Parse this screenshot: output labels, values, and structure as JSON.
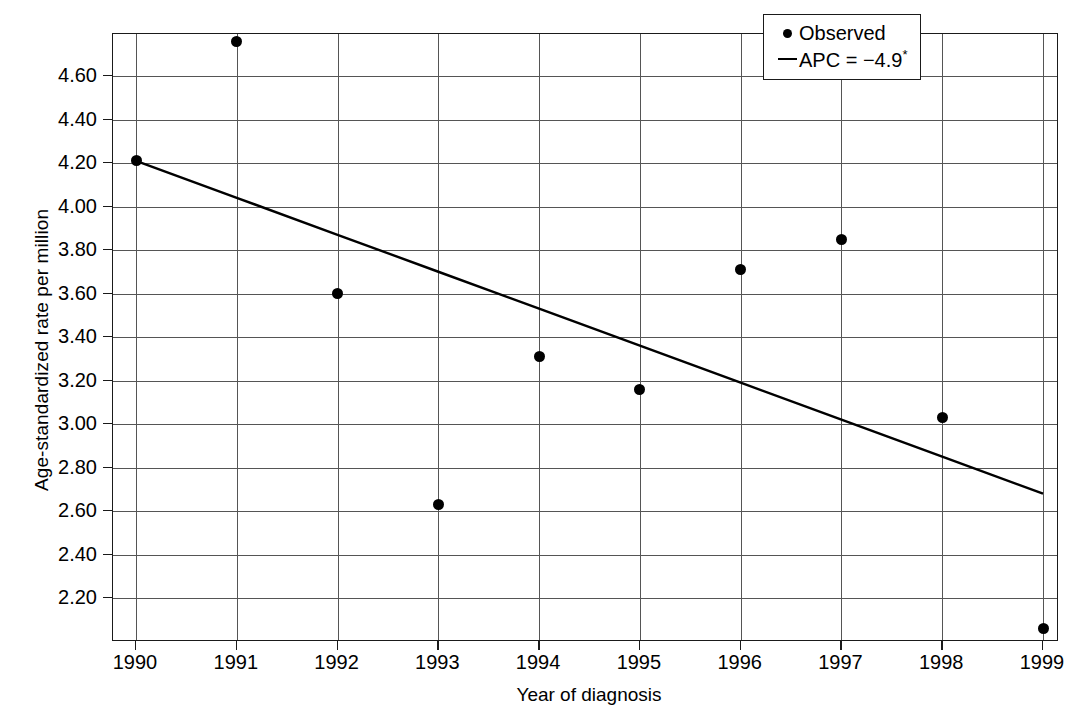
{
  "chart_data": {
    "type": "scatter",
    "title": "",
    "xlabel": "Year of diagnosis",
    "ylabel": "Age-standardized rate per million",
    "x": [
      1990,
      1991,
      1992,
      1993,
      1994,
      1995,
      1996,
      1997,
      1998,
      1999
    ],
    "categories": [
      "1990",
      "1991",
      "1992",
      "1993",
      "1994",
      "1995",
      "1996",
      "1997",
      "1998",
      "1999"
    ],
    "series": [
      {
        "name": "Observed",
        "type": "scatter",
        "values": [
          4.21,
          4.76,
          3.6,
          2.63,
          3.31,
          3.16,
          3.71,
          3.85,
          3.03,
          2.06
        ]
      },
      {
        "name": "APC = −4.9*",
        "type": "line",
        "values": [
          4.21,
          4.04,
          3.87,
          3.7,
          3.53,
          3.36,
          3.19,
          3.02,
          2.85,
          2.68
        ]
      }
    ],
    "xlim": [
      1990,
      1999
    ],
    "ylim": [
      2.06,
      4.82
    ],
    "ytick_values": [
      4.6,
      4.4,
      4.2,
      4.0,
      3.8,
      3.6,
      3.4,
      3.2,
      3.0,
      2.8,
      2.6,
      2.4,
      2.2
    ],
    "ytick_labels": [
      "4.60",
      "4.40",
      "4.20",
      "4.00",
      "3.80",
      "3.60",
      "3.40",
      "3.20",
      "3.00",
      "2.80",
      "2.60",
      "2.40",
      "2.20"
    ],
    "xtick_labels": [
      "1990",
      "1991",
      "1992",
      "1993",
      "1994",
      "1995",
      "1996",
      "1997",
      "1998",
      "1999"
    ],
    "grid": true,
    "legend_position": "top-right",
    "annotation": "APC = −4.9*"
  },
  "legend": {
    "items": [
      {
        "key": "dot-marker-icon",
        "label": "Observed"
      },
      {
        "key": "line-marker-icon",
        "label": "APC = −4.9",
        "superscript": "*"
      }
    ]
  },
  "axes": {
    "x_title": "Year of diagnosis",
    "y_title": "Age-standardized rate per million"
  },
  "colors": {
    "foreground": "#000000",
    "grid": "#555555",
    "frame": "#1a1a1a",
    "background": "#ffffff"
  }
}
